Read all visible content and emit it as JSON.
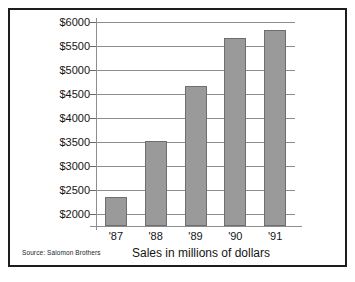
{
  "chart_data": {
    "type": "bar",
    "title": "",
    "xlabel": "Sales in millions of dollars",
    "ylabel": "",
    "categories": [
      "'87",
      "'88",
      "'89",
      "'90",
      "'91"
    ],
    "values": [
      2350,
      3520,
      4670,
      5670,
      5830
    ],
    "ylim": [
      1750,
      6000
    ],
    "ytick_values": [
      2000,
      2500,
      3000,
      3500,
      4000,
      4500,
      5000,
      5500,
      6000
    ],
    "ytick_labels": [
      "$2000",
      "$2500",
      "$3000",
      "$3500",
      "$4000",
      "$4500",
      "$5000",
      "$5500",
      "$6000"
    ],
    "grid": true,
    "legend": false,
    "bar_color": "#9a9a9a",
    "bar_border_color": "#6e6e6e",
    "grid_color": "#8e8e8e",
    "source_note": "Source: Salomon Brothers"
  },
  "figure": {
    "frame_color": "#1d1d1d",
    "background": "#ffffff"
  }
}
